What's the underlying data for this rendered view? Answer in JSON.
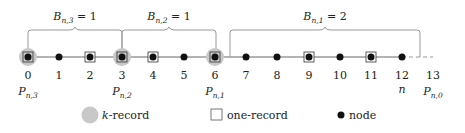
{
  "diagram": {
    "braces": [
      {
        "label": "B",
        "sub": "n,3",
        "eq": " = 1",
        "from": 0,
        "to": 3
      },
      {
        "label": "B",
        "sub": "n,2",
        "eq": " = 1",
        "from": 3,
        "to": 6
      },
      {
        "label": "B",
        "sub": "n,1",
        "eq": " = 2",
        "from": 6,
        "to": 13
      }
    ],
    "positions": [
      "0",
      "1",
      "2",
      "3",
      "4",
      "5",
      "6",
      "7",
      "8",
      "9",
      "10",
      "11",
      "12",
      "13"
    ],
    "node_types": [
      "k",
      "node",
      "one",
      "k",
      "one",
      "node",
      "k",
      "node",
      "node",
      "one",
      "node",
      "one",
      "node",
      "end"
    ],
    "under_labels": [
      {
        "pos": 0,
        "label": "P",
        "sub": "n,3"
      },
      {
        "pos": 3,
        "label": "P",
        "sub": "n,2"
      },
      {
        "pos": 6,
        "label": "P",
        "sub": "n,1"
      },
      {
        "pos": 12,
        "label": "n",
        "sub": ""
      },
      {
        "pos": 13,
        "label": "P",
        "sub": "n,0"
      }
    ],
    "legend": [
      {
        "icon": "k-record-icon",
        "label_italic": "k",
        "label": "-record"
      },
      {
        "icon": "one-record-icon",
        "label_italic": "",
        "label": "one-record"
      },
      {
        "icon": "node-icon",
        "label_italic": "",
        "label": "node"
      }
    ],
    "colors": {
      "line": "#9a9a9a",
      "krecord": "#c8c8c8",
      "node": "#111111",
      "dotted": "#aaaaaa"
    }
  }
}
